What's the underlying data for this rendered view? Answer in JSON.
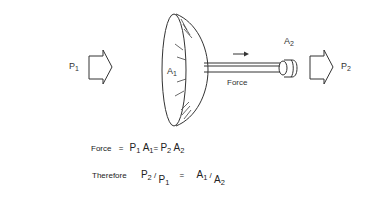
{
  "labels": {
    "p1": "P",
    "p1_sub": "1",
    "a1": "A",
    "a1_sub": "1",
    "a2": "A",
    "a2_sub": "2",
    "p2": "P",
    "p2_sub": "2",
    "force": "Force"
  },
  "equations": {
    "line1": {
      "lead": "Force",
      "eq1": "=",
      "t1": "P",
      "t1_sub": "1",
      "t2": "A",
      "t2_sub": "1",
      "eq2": "=",
      "t3": "P",
      "t3_sub": "2",
      "t4": "A",
      "t4_sub": "2"
    },
    "line2": {
      "lead": "Therefore",
      "n1": "P",
      "n1_sub": "2",
      "slash1": "/",
      "d1": "P",
      "d1_sub": "1",
      "eq": "=",
      "n2": "A",
      "n2_sub": "1",
      "slash2": "/",
      "d2": "A",
      "d2_sub": "2"
    }
  },
  "colors": {
    "line": "#333333",
    "background": "#ffffff"
  }
}
